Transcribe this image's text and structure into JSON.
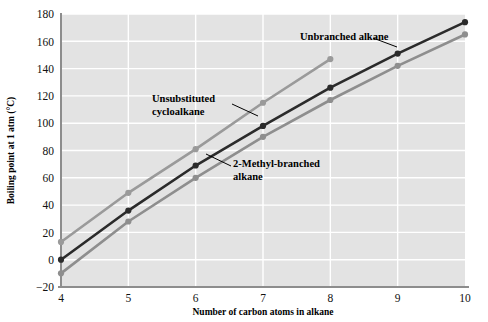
{
  "chart_data": {
    "type": "line",
    "title": "",
    "xlabel": "Number of carbon atoms in alkane",
    "ylabel": "Boiling point at 1 atm (°C)",
    "xlim": [
      4,
      10
    ],
    "ylim": [
      -20,
      180
    ],
    "xticks": [
      "4",
      "5",
      "6",
      "7",
      "8",
      "9",
      "10"
    ],
    "yticks": [
      "−20",
      "0",
      "20",
      "40",
      "60",
      "80",
      "100",
      "120",
      "140",
      "160",
      "180"
    ],
    "xtick_values": [
      4,
      5,
      6,
      7,
      8,
      9,
      10
    ],
    "ytick_values": [
      -20,
      0,
      20,
      40,
      60,
      80,
      100,
      120,
      140,
      160,
      180
    ],
    "grid": true,
    "grid_color": "#ffffff",
    "plot_background": "#e3e3e3",
    "legend": "none",
    "series": [
      {
        "name": "Unsubstituted cycloalkane",
        "color": "#9a9a9a",
        "x": [
          4,
          5,
          6,
          7,
          8
        ],
        "values": [
          13,
          49,
          81,
          115,
          147
        ]
      },
      {
        "name": "Unbranched alkane",
        "color": "#2b2b2b",
        "x": [
          4,
          5,
          6,
          7,
          8,
          9,
          10
        ],
        "values": [
          0,
          36,
          69,
          98,
          126,
          151,
          174
        ]
      },
      {
        "name": "2-Methyl-branched alkane",
        "color": "#8e8e8e",
        "x": [
          4,
          5,
          6,
          7,
          8,
          9,
          10
        ],
        "values": [
          -10,
          28,
          60,
          90,
          117,
          142,
          165
        ]
      }
    ],
    "annotations": [
      {
        "text_line1": "Unbranched alkane",
        "text_line2": "",
        "x": 300,
        "y": 40
      },
      {
        "text_line1": "Unsubstituted",
        "text_line2": "cycloalkane",
        "x": 152,
        "y": 102
      },
      {
        "text_line1": "2-Methyl-branched",
        "text_line2": "alkane",
        "x": 233,
        "y": 167
      }
    ]
  },
  "axes": {
    "x_title": "Number of carbon atoms in alkane",
    "y_title": "Boiling point at 1 atm (°C)"
  }
}
